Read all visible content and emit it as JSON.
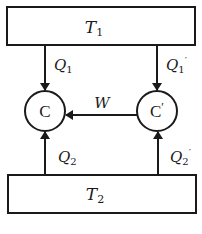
{
  "diagram": {
    "hot_reservoir": {
      "label": "T",
      "subscript": "1"
    },
    "cold_reservoir": {
      "label": "T",
      "subscript": "2"
    },
    "engine_left": {
      "label": "C"
    },
    "engine_right": {
      "label": "C",
      "prime": "′"
    },
    "flows": {
      "q1": {
        "label": "Q",
        "subscript": "1",
        "prime": ""
      },
      "q1_prime": {
        "label": "Q",
        "subscript": "1",
        "prime": "′"
      },
      "q2": {
        "label": "Q",
        "subscript": "2",
        "prime": ""
      },
      "q2_prime": {
        "label": "Q",
        "subscript": "2",
        "prime": "′"
      },
      "work": {
        "label": "W"
      }
    },
    "colors": {
      "stroke": "#1a1a1a",
      "background": "#ffffff"
    }
  }
}
